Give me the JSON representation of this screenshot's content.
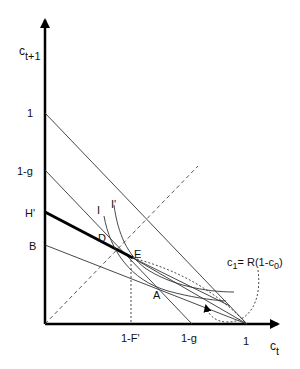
{
  "diagram": {
    "type": "economics-budget-constraint",
    "axes": {
      "x_label": "c",
      "x_label_sub": "t",
      "y_label": "c",
      "y_label_sub": "t+1"
    },
    "y_ticks": [
      {
        "label": "1",
        "y": 113
      },
      {
        "label": "1-g",
        "y": 170
      },
      {
        "label": "H'",
        "y": 212
      },
      {
        "label": "B",
        "y": 245
      }
    ],
    "x_ticks": [
      {
        "label": "1-F'",
        "x": 131
      },
      {
        "label": "1-g",
        "x": 192
      },
      {
        "label": "1",
        "x": 247
      }
    ],
    "points": [
      {
        "label": "D"
      },
      {
        "label": "E"
      },
      {
        "label": "A"
      }
    ],
    "curves": [
      {
        "label": "I"
      },
      {
        "label": "I'"
      }
    ],
    "annotation": {
      "c": "c",
      "c_sub": "1",
      "eq": "= R(1-c",
      "c0_sub": "0",
      "close": ")"
    },
    "colors": {
      "line": "#222222",
      "thick_line": "#000000",
      "background": "#ffffff"
    }
  }
}
